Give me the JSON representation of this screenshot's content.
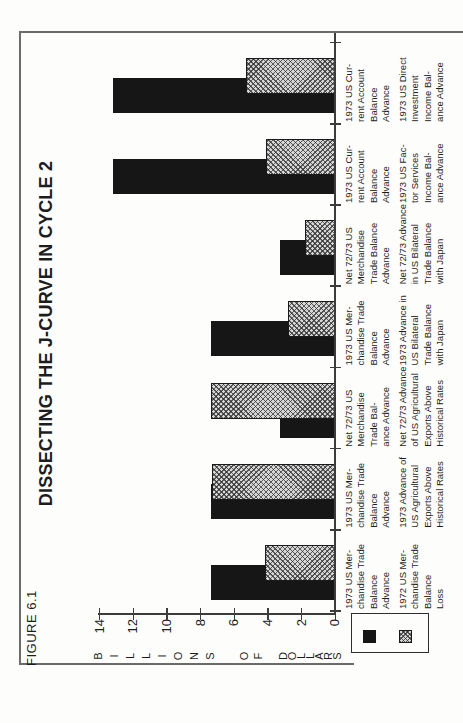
{
  "page": {
    "figure_label": "FIGURE 6.1",
    "title": "DISSECTING THE J-CURVE IN CYCLE 2"
  },
  "chart_data": {
    "type": "bar",
    "title": "DISSECTING THE J-CURVE IN CYCLE 2",
    "figure_label": "FIGURE 6.1",
    "ylabel": "BILLIONS OF DOLLARS",
    "ylim": [
      0,
      14
    ],
    "y_ticks": [
      "14",
      "12",
      "10",
      "8",
      "6",
      "4",
      "2",
      "0"
    ],
    "orientation": "landscape chart rotated 90 degrees counterclockwise on portrait page; bars overlap within each group, hatched bar drawn in front",
    "grid": "off",
    "legend": {
      "position": "bottom-left",
      "swatches": [
        "solid-black",
        "hatched-gray"
      ]
    },
    "series_styles": {
      "solid": "solid black bar (first-row label)",
      "hatched": "gray diagonal crosshatch bar (second-row label)"
    },
    "groups": [
      {
        "solid": {
          "label_lines": [
            "1973 US Mer-",
            "chandise Trade",
            "Balance",
            "Advance"
          ],
          "value": 7.4
        },
        "hatched": {
          "label_lines": [
            "1972 US Mer-",
            "chandise Trade",
            "Balance",
            "Loss"
          ],
          "value": 4.2
        }
      },
      {
        "solid": {
          "label_lines": [
            "1973 US Mer-",
            "chandise Trade",
            "Balance",
            "Advance"
          ],
          "value": 7.4
        },
        "hatched": {
          "label_lines": [
            "1973 Advance of",
            "US Agricultural",
            "Exports Above",
            "Historical Rates"
          ],
          "value": 7.3
        }
      },
      {
        "solid": {
          "label_lines": [
            "Net 72/73 US",
            "Merchandise",
            "Trade Bal-",
            "ance Advance"
          ],
          "value": 3.3
        },
        "hatched": {
          "label_lines": [
            "Net 72/73 Advance",
            "of US Agricultural",
            "Exports Above",
            "Historical Rates"
          ],
          "value": 7.4
        }
      },
      {
        "solid": {
          "label_lines": [
            "1973 US Mer-",
            "chandise Trade",
            "Balance",
            "Advance"
          ],
          "value": 7.4
        },
        "hatched": {
          "label_lines": [
            "1973 Advance in",
            "US Bilateral",
            "Trade Balance",
            "with Japan"
          ],
          "value": 2.8
        }
      },
      {
        "solid": {
          "label_lines": [
            "Net 72/73 US",
            "Merchandise",
            "Trade Balance",
            "Advance"
          ],
          "value": 3.3
        },
        "hatched": {
          "label_lines": [
            "Net 72/73 Advance",
            "in US Bilateral",
            "Trade Balance",
            "with Japan"
          ],
          "value": 1.8
        }
      },
      {
        "solid": {
          "label_lines": [
            "1973 US Cur-",
            "rent Account",
            "Balance",
            "Advance"
          ],
          "value": 13.2
        },
        "hatched": {
          "label_lines": [
            "1973 US Fac-",
            "tor Services",
            "Income Bal-",
            "ance Advance"
          ],
          "value": 4.1
        }
      },
      {
        "solid": {
          "label_lines": [
            "1973 US Cur-",
            "rent Account",
            "Balance",
            "Advance"
          ],
          "value": 13.2
        },
        "hatched": {
          "label_lines": [
            "1973 US Direct",
            "Investment",
            "Income Bal-",
            "ance Advance"
          ],
          "value": 5.3
        }
      }
    ],
    "colors": {
      "bar_solid": "#161616",
      "hatch_base": "#d6d6d6",
      "hatch_line": "#2d2d2d",
      "axis_line": "#3c3c3c",
      "frame_line": "#6b6b6b",
      "text": "#1d1d1d",
      "page_bg": "#fdfdfc"
    }
  }
}
